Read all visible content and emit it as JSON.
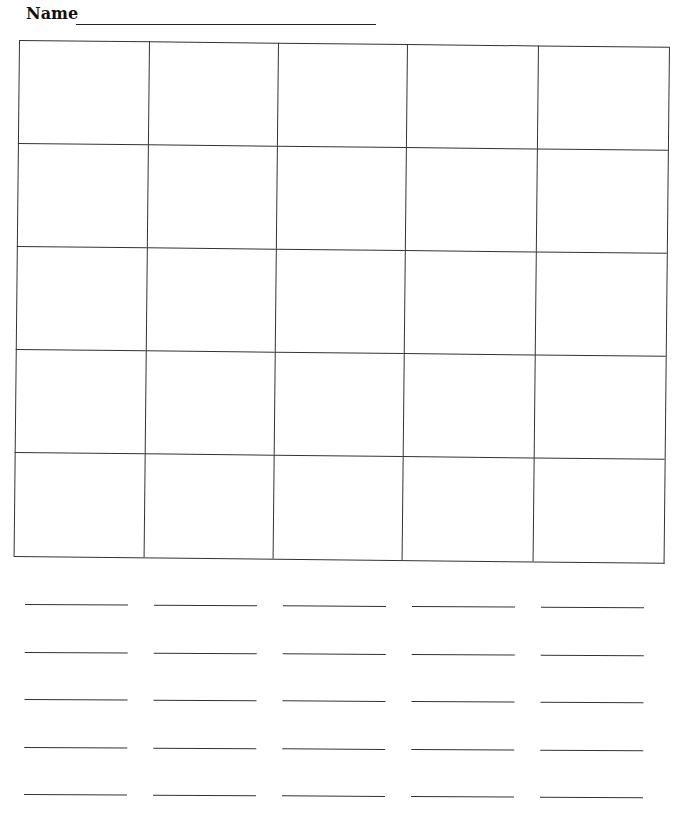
{
  "header": {
    "name_label": "Name",
    "name_value": ""
  },
  "grid": {
    "rows": 5,
    "columns": 5,
    "cells": [
      [
        "",
        "",
        "",
        "",
        ""
      ],
      [
        "",
        "",
        "",
        "",
        ""
      ],
      [
        "",
        "",
        "",
        "",
        ""
      ],
      [
        "",
        "",
        "",
        "",
        ""
      ],
      [
        "",
        "",
        "",
        "",
        ""
      ]
    ]
  },
  "answer_lines": {
    "rows": 5,
    "columns": 5,
    "values": [
      [
        "",
        "",
        "",
        "",
        ""
      ],
      [
        "",
        "",
        "",
        "",
        ""
      ],
      [
        "",
        "",
        "",
        "",
        ""
      ],
      [
        "",
        "",
        "",
        "",
        ""
      ],
      [
        "",
        "",
        "",
        "",
        ""
      ]
    ]
  }
}
